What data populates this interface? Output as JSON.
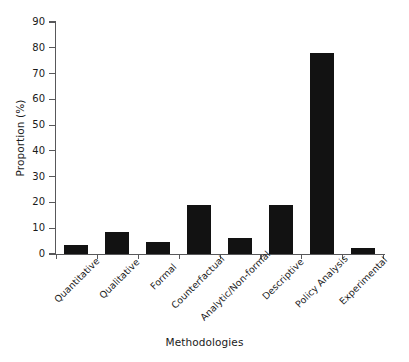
{
  "chart_data": {
    "type": "bar",
    "title": "",
    "xlabel": "Methodologies",
    "ylabel": "Proportion (%)",
    "categories": [
      "Quantitative",
      "Qualitative",
      "Formal",
      "Counterfactual",
      "Analytic/Non-formal",
      "Descriptive",
      "Policy Analysis",
      "Experimental"
    ],
    "values": [
      3.5,
      8.5,
      4.7,
      19,
      6.2,
      19,
      78,
      2.4
    ],
    "ylim": [
      0,
      90
    ],
    "ytick_labels": [
      "0",
      "10",
      "20",
      "30",
      "40",
      "50",
      "60",
      "70",
      "80",
      "90"
    ],
    "ytick_values": [
      0,
      10,
      20,
      30,
      40,
      50,
      60,
      70,
      80,
      90
    ],
    "grid": "off",
    "legend": "none",
    "bar_color": "#121212",
    "axis_color": "#58585a",
    "text_color": "#1a1a1a",
    "background": "#ffffff"
  }
}
